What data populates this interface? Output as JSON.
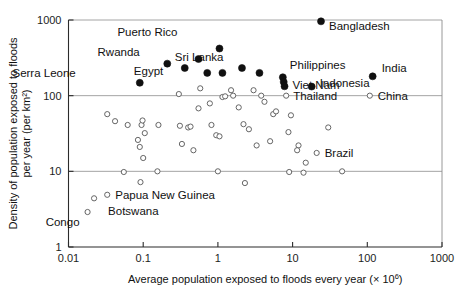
{
  "chart_data": {
    "type": "scatter",
    "title": "",
    "xlabel": "Average  population exposed to floods every year (× 10⁶)",
    "ylabel_line1": "Density of population exposed to floods",
    "ylabel_line2": "per year (per km²)",
    "xscale": "log",
    "yscale": "log",
    "xlim": [
      0.01,
      1000
    ],
    "ylim": [
      1,
      1000
    ],
    "xticks": [
      0.01,
      0.1,
      1,
      10,
      100,
      1000
    ],
    "xtick_labels": [
      "0.01",
      "0.1",
      "1",
      "10",
      "100",
      "1000"
    ],
    "yticks": [
      1,
      10,
      100,
      1000
    ],
    "ytick_labels": [
      "1",
      "10",
      "100",
      "1000"
    ],
    "grid": "horizontal",
    "legend": "none",
    "series": [
      {
        "name": "Labelled high-density countries",
        "marker": "filled-circle",
        "color": "#101010",
        "points": [
          {
            "label": "Serra Leone",
            "x": 0.09,
            "y": 148,
            "label_dx": -64,
            "label_dy": -6
          },
          {
            "label": "",
            "x": 0.21,
            "y": 265
          },
          {
            "label": "Rwanda",
            "x": 0.36,
            "y": 232,
            "label_dx": -45,
            "label_dy": -12
          },
          {
            "label": "",
            "x": 0.55,
            "y": 305
          },
          {
            "label": "Egypt",
            "x": 0.72,
            "y": 200,
            "label_dx": -44,
            "label_dy": 2
          },
          {
            "label": "Puerto Rico",
            "x": 1.05,
            "y": 420,
            "label_dx": -42,
            "label_dy": -13
          },
          {
            "label": "",
            "x": 1.15,
            "y": 200
          },
          {
            "label": "",
            "x": 2.1,
            "y": 232
          },
          {
            "label": "Sri Lanka",
            "x": 3.6,
            "y": 200,
            "label_dx": -36,
            "label_dy": -12
          },
          {
            "label": "Philippines",
            "x": 7.4,
            "y": 175,
            "label_dx": 7,
            "label_dy": -8
          },
          {
            "label": "",
            "x": 7.6,
            "y": 152
          },
          {
            "label": "Viet Nam",
            "x": 7.8,
            "y": 133,
            "label_dx": 8,
            "label_dy": 3
          },
          {
            "label": "Indonesia",
            "x": 18.0,
            "y": 132,
            "label_dx": 8,
            "label_dy": 0
          },
          {
            "label": "Bangladesh",
            "x": 24.0,
            "y": 960,
            "label_dx": 8,
            "label_dy": 9
          },
          {
            "label": "India",
            "x": 118.0,
            "y": 180,
            "label_dx": 9,
            "label_dy": -4
          }
        ]
      },
      {
        "name": "Labelled lower-density countries",
        "marker": "open-circle",
        "color": "#5e5e5e",
        "points": [
          {
            "label": "Congo",
            "x": 0.018,
            "y": 2.9,
            "label_dx": -8,
            "label_dy": 14
          },
          {
            "label": "Botswana",
            "x": 0.022,
            "y": 4.4,
            "label_dx": 14,
            "label_dy": 17
          },
          {
            "label": "Papua New Guinea",
            "x": 0.033,
            "y": 4.9,
            "label_dx": 8,
            "label_dy": 4
          },
          {
            "label": "Thailand",
            "x": 8.2,
            "y": 100,
            "label_dx": 7,
            "label_dy": 4
          },
          {
            "label": "China",
            "x": 108.0,
            "y": 100,
            "label_dx": 8,
            "label_dy": 4
          },
          {
            "label": "Brazil",
            "x": 21.0,
            "y": 17.5,
            "label_dx": 8,
            "label_dy": 4
          }
        ]
      },
      {
        "name": "Unlabelled countries",
        "marker": "open-circle",
        "color": "#5e5e5e",
        "points": [
          {
            "x": 0.055,
            "y": 9.8
          },
          {
            "x": 0.042,
            "y": 46
          },
          {
            "x": 0.033,
            "y": 57
          },
          {
            "x": 0.062,
            "y": 41
          },
          {
            "x": 0.095,
            "y": 41
          },
          {
            "x": 0.098,
            "y": 47
          },
          {
            "x": 0.105,
            "y": 32
          },
          {
            "x": 0.09,
            "y": 21
          },
          {
            "x": 0.092,
            "y": 7.2
          },
          {
            "x": 0.1,
            "y": 15
          },
          {
            "x": 0.085,
            "y": 26
          },
          {
            "x": 0.16,
            "y": 41
          },
          {
            "x": 0.155,
            "y": 10
          },
          {
            "x": 0.3,
            "y": 105
          },
          {
            "x": 0.31,
            "y": 40
          },
          {
            "x": 0.33,
            "y": 23
          },
          {
            "x": 0.4,
            "y": 38
          },
          {
            "x": 0.43,
            "y": 39
          },
          {
            "x": 0.47,
            "y": 19
          },
          {
            "x": 0.55,
            "y": 68
          },
          {
            "x": 0.58,
            "y": 125
          },
          {
            "x": 0.78,
            "y": 79
          },
          {
            "x": 0.82,
            "y": 41
          },
          {
            "x": 0.95,
            "y": 30
          },
          {
            "x": 1.05,
            "y": 29
          },
          {
            "x": 1.0,
            "y": 10
          },
          {
            "x": 1.15,
            "y": 96
          },
          {
            "x": 1.25,
            "y": 98
          },
          {
            "x": 1.5,
            "y": 118
          },
          {
            "x": 1.6,
            "y": 100
          },
          {
            "x": 1.9,
            "y": 70
          },
          {
            "x": 2.2,
            "y": 42
          },
          {
            "x": 2.6,
            "y": 36
          },
          {
            "x": 2.3,
            "y": 7.0
          },
          {
            "x": 3.0,
            "y": 118
          },
          {
            "x": 3.8,
            "y": 100
          },
          {
            "x": 4.2,
            "y": 83
          },
          {
            "x": 5.0,
            "y": 25
          },
          {
            "x": 5.5,
            "y": 57
          },
          {
            "x": 6.0,
            "y": 62
          },
          {
            "x": 3.3,
            "y": 22
          },
          {
            "x": 8.8,
            "y": 33
          },
          {
            "x": 12.0,
            "y": 22
          },
          {
            "x": 11.5,
            "y": 19
          },
          {
            "x": 9.5,
            "y": 55
          },
          {
            "x": 9.0,
            "y": 9.8
          },
          {
            "x": 15.0,
            "y": 13
          },
          {
            "x": 14.0,
            "y": 9.6
          },
          {
            "x": 30.0,
            "y": 38
          },
          {
            "x": 46.0,
            "y": 10
          }
        ]
      }
    ]
  }
}
